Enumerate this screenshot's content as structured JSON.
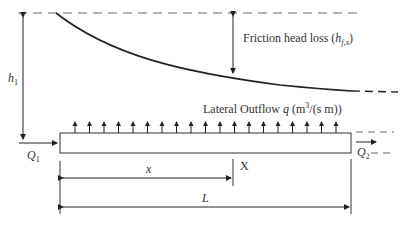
{
  "diagram": {
    "labels": {
      "friction_head_loss": "Friction head loss (",
      "friction_symbol": "h",
      "friction_sub": "f,x",
      "friction_close": ")",
      "h1_symbol": "h",
      "h1_sub": "1",
      "lateral_outflow": "Lateral Outflow ",
      "q_symbol": "q",
      "q_units_open": " (m",
      "q_units_sup": "3",
      "q_units_rest": "/(s m))",
      "q1_symbol": "Q",
      "q1_sub": "1",
      "q2_symbol": "Q",
      "q2_sub": "2",
      "x_symbol": "x",
      "section_mark": "X",
      "length_symbol": "L"
    },
    "outflow_arrow_count": 19,
    "colors": {
      "line": "#222222",
      "dashed": "#555555",
      "text": "#333333"
    }
  }
}
